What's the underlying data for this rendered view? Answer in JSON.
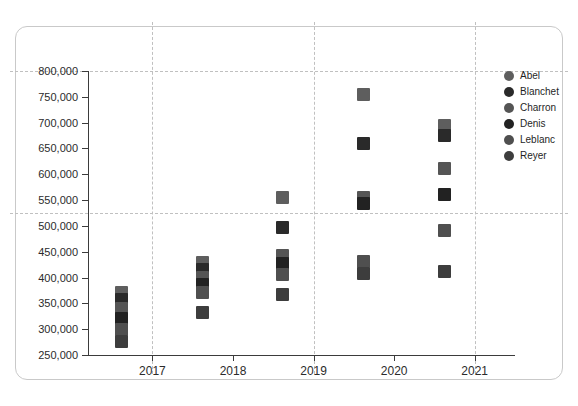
{
  "chart_data": {
    "type": "scatter",
    "title": "",
    "subtitle": "",
    "xlabel": "",
    "ylabel": "",
    "xlim": [
      2016.2,
      2021.5
    ],
    "ylim": [
      250000,
      800000
    ],
    "grid": true,
    "grid_x_values": [
      2017,
      2019,
      2021
    ],
    "grid_y_values": [
      800000,
      525000
    ],
    "legend_position": "right",
    "x_ticks": [
      2017,
      2018,
      2019,
      2020,
      2021
    ],
    "x_tick_labels": [
      "2017",
      "2018",
      "2019",
      "2020",
      "2021"
    ],
    "y_ticks": [
      250000,
      300000,
      350000,
      400000,
      450000,
      500000,
      550000,
      600000,
      650000,
      700000,
      750000,
      800000
    ],
    "y_tick_labels": [
      "250,000",
      "300,000",
      "350,000",
      "400,000",
      "450,000",
      "500,000",
      "550,000",
      "600,000",
      "650,000",
      "700,000",
      "750,000",
      "800,000"
    ],
    "marker_shape": "square",
    "marker_color": "#3a3a3a",
    "series": [
      {
        "name": "Abel",
        "color": "#5e5e5e",
        "points": [
          {
            "x": 2016.62,
            "y": 372000
          },
          {
            "x": 2017.62,
            "y": 430000
          },
          {
            "x": 2018.62,
            "y": 555000
          },
          {
            "x": 2019.62,
            "y": 755000
          },
          {
            "x": 2020.62,
            "y": 695000
          }
        ]
      },
      {
        "name": "Blanchet",
        "color": "#2a2a2a",
        "points": [
          {
            "x": 2016.62,
            "y": 358000
          },
          {
            "x": 2017.62,
            "y": 415000
          },
          {
            "x": 2018.62,
            "y": 497000
          },
          {
            "x": 2019.62,
            "y": 660000
          },
          {
            "x": 2020.62,
            "y": 676000
          }
        ]
      },
      {
        "name": "Charron",
        "color": "#555555",
        "points": [
          {
            "x": 2016.62,
            "y": 340000
          },
          {
            "x": 2017.62,
            "y": 400000
          },
          {
            "x": 2018.62,
            "y": 443000
          },
          {
            "x": 2019.62,
            "y": 555000
          },
          {
            "x": 2020.62,
            "y": 612000
          }
        ]
      },
      {
        "name": "Denis",
        "color": "#222222",
        "points": [
          {
            "x": 2016.62,
            "y": 320000
          },
          {
            "x": 2017.62,
            "y": 386000
          },
          {
            "x": 2018.62,
            "y": 428000
          },
          {
            "x": 2019.62,
            "y": 543000
          },
          {
            "x": 2020.62,
            "y": 560000
          }
        ]
      },
      {
        "name": "Leblanc",
        "color": "#4f4f4f",
        "points": [
          {
            "x": 2016.62,
            "y": 300000
          },
          {
            "x": 2017.62,
            "y": 372000
          },
          {
            "x": 2018.62,
            "y": 405000
          },
          {
            "x": 2019.62,
            "y": 432000
          },
          {
            "x": 2020.62,
            "y": 492000
          }
        ]
      },
      {
        "name": "Reyer",
        "color": "#3d3d3d",
        "points": [
          {
            "x": 2016.62,
            "y": 277000
          },
          {
            "x": 2017.62,
            "y": 333000
          },
          {
            "x": 2018.62,
            "y": 367000
          },
          {
            "x": 2019.62,
            "y": 408000
          },
          {
            "x": 2020.62,
            "y": 412000
          }
        ]
      }
    ]
  },
  "legend": {
    "items": [
      {
        "label": "Abel",
        "color": "#5e5e5e"
      },
      {
        "label": "Blanchet",
        "color": "#2a2a2a"
      },
      {
        "label": "Charron",
        "color": "#555555"
      },
      {
        "label": "Denis",
        "color": "#222222"
      },
      {
        "label": "Leblanc",
        "color": "#4f4f4f"
      },
      {
        "label": "Reyer",
        "color": "#3d3d3d"
      }
    ]
  },
  "style": {
    "background": "#ffffff",
    "axis_color": "#3b3b3b",
    "grid_color": "#c0c0c0",
    "frame_color": "#c9c9c9",
    "text_color": "#2b2b2b"
  }
}
